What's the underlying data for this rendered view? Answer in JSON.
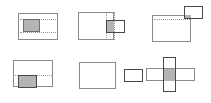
{
  "figure": {
    "width": 211,
    "height": 103,
    "background": "#ffffff",
    "colors": {
      "outline": "#8a8a8a",
      "outline_dark": "#4a4a4a",
      "fill": "#b4b4b4",
      "fill_border": "#6e6e6e",
      "guide": "#9a9a9a"
    },
    "grid": {
      "rows": 2,
      "cols": 3,
      "cell_width": 70,
      "cell_height": 51
    }
  },
  "cells": [
    {
      "id": "case-1",
      "name": "contained",
      "description": "Small rectangle fully inside large rectangle",
      "origin": {
        "x": 0,
        "y": 0
      },
      "outer": {
        "x": 18,
        "y": 13,
        "w": 40,
        "h": 27
      },
      "inner": {
        "x": 23,
        "y": 19,
        "w": 17,
        "h": 13
      },
      "inner_filled": true,
      "guides": [
        {
          "type": "h",
          "x": 20,
          "y": 19,
          "len": 36
        },
        {
          "type": "h",
          "x": 20,
          "y": 32,
          "len": 36
        }
      ]
    },
    {
      "id": "case-2",
      "name": "overlap-right-edge",
      "description": "Small rectangle straddles the right edge of the large rectangle",
      "origin": {
        "x": 70,
        "y": 0
      },
      "outer": {
        "x": 8,
        "y": 12,
        "w": 36,
        "h": 28
      },
      "inner": {
        "x": 36,
        "y": 20,
        "w": 19,
        "h": 13
      },
      "overlap": {
        "x": 36,
        "y": 20,
        "w": 8,
        "h": 13
      },
      "guides": [
        {
          "type": "v",
          "x": 36,
          "y": 12,
          "len": 28
        },
        {
          "type": "v",
          "x": 44,
          "y": 12,
          "len": 28
        }
      ]
    },
    {
      "id": "case-3",
      "name": "overlap-top-right-corner",
      "description": "Small rectangle overlaps the top-right corner of the large rectangle",
      "origin": {
        "x": 140,
        "y": 0
      },
      "outer": {
        "x": 12,
        "y": 15,
        "w": 39,
        "h": 27
      },
      "inner": {
        "x": 44,
        "y": 6,
        "w": 19,
        "h": 13
      },
      "overlap": {
        "x": 44,
        "y": 15,
        "w": 7,
        "h": 4
      },
      "guides": [
        {
          "type": "h",
          "x": 14,
          "y": 19,
          "len": 36
        }
      ]
    },
    {
      "id": "case-4",
      "name": "overlap-bottom-left-edge",
      "description": "Small rectangle straddles the bottom edge of the large rectangle",
      "origin": {
        "x": 0,
        "y": 52
      },
      "outer": {
        "x": 13,
        "y": 8,
        "w": 40,
        "h": 27
      },
      "inner": {
        "x": 18,
        "y": 23,
        "w": 19,
        "h": 13
      },
      "overlap": {
        "x": 18,
        "y": 23,
        "w": 19,
        "h": 12
      },
      "guides": [
        {
          "type": "h",
          "x": 15,
          "y": 23,
          "len": 37
        }
      ]
    },
    {
      "id": "case-5",
      "name": "disjoint",
      "description": "Two rectangles that do not intersect",
      "origin": {
        "x": 70,
        "y": 52
      },
      "outer": {
        "x": 9,
        "y": 10,
        "w": 37,
        "h": 27
      },
      "inner": {
        "x": 54,
        "y": 17,
        "w": 19,
        "h": 13
      },
      "overlap": null,
      "guides": []
    },
    {
      "id": "case-6",
      "name": "cross-intersection",
      "description": "Horizontal and vertical rectangles crossing in a plus shape",
      "origin": {
        "x": 140,
        "y": 52
      },
      "horizontal": {
        "x": 6,
        "y": 16,
        "w": 49,
        "h": 13
      },
      "vertical": {
        "x": 23,
        "y": 5,
        "w": 13,
        "h": 35
      },
      "overlap": {
        "x": 23,
        "y": 16,
        "w": 13,
        "h": 13
      },
      "guides": []
    }
  ]
}
